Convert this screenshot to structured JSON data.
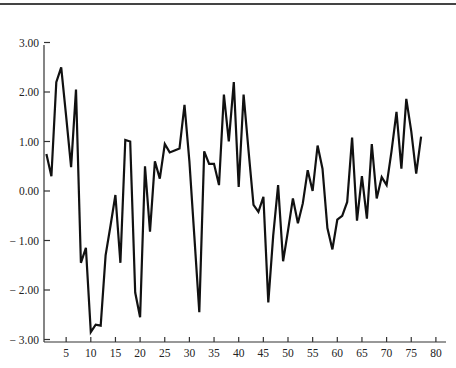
{
  "chart_data": {
    "type": "line",
    "title": "",
    "xlabel": "",
    "ylabel": "",
    "xlim": [
      0,
      81
    ],
    "ylim": [
      -3.0,
      3.0
    ],
    "x_ticks": [
      5,
      10,
      15,
      20,
      25,
      30,
      35,
      40,
      45,
      50,
      55,
      60,
      65,
      70,
      75,
      80
    ],
    "y_ticks": [
      3.0,
      2.0,
      1.0,
      0.0,
      -1.0,
      -2.0,
      -3.0
    ],
    "y_tick_labels": [
      "3.00",
      "2.00",
      "1.00",
      "0.00",
      "− 1.00",
      "− 2.00",
      "− 3.00"
    ],
    "grid": false,
    "legend": null,
    "series": [
      {
        "name": "series",
        "x": [
          1,
          2,
          3,
          4,
          5,
          6,
          7,
          8,
          9,
          10,
          11,
          12,
          13,
          14,
          15,
          16,
          17,
          18,
          19,
          20,
          21,
          22,
          23,
          24,
          25,
          26,
          27,
          28,
          29,
          30,
          31,
          32,
          33,
          34,
          35,
          36,
          37,
          38,
          39,
          40,
          41,
          42,
          43,
          44,
          45,
          46,
          47,
          48,
          49,
          50,
          51,
          52,
          53,
          54,
          55,
          56,
          57,
          58,
          59,
          60,
          61,
          62,
          63,
          64,
          65,
          66,
          67,
          68,
          69,
          70,
          71,
          72,
          73,
          74,
          75,
          76,
          77,
          78,
          79,
          80
        ],
        "values": [
          0.75,
          0.3,
          2.2,
          2.5,
          1.5,
          0.48,
          2.05,
          -1.45,
          -1.15,
          -2.85,
          -2.7,
          -2.72,
          -1.3,
          -0.7,
          -0.08,
          -1.45,
          1.03,
          1.0,
          -2.05,
          -2.55,
          0.5,
          -0.82,
          0.6,
          0.25,
          0.95,
          0.78,
          0.82,
          0.86,
          1.74,
          0.6,
          -0.9,
          -2.45,
          0.8,
          0.55,
          0.55,
          0.12,
          1.95,
          1.0,
          2.2,
          0.08,
          1.95,
          0.8,
          -0.28,
          -0.42,
          -0.12,
          -2.25,
          -0.9,
          0.12,
          -1.42,
          -0.8,
          -0.15,
          -0.65,
          -0.25,
          0.42,
          0.0,
          0.92,
          0.45,
          -0.75,
          -1.18,
          -0.58,
          -0.5,
          -0.22,
          1.08,
          -0.6,
          0.3,
          -0.56,
          0.95,
          -0.15,
          0.28,
          0.12,
          0.8,
          1.6,
          0.45,
          1.86,
          1.2,
          0.35,
          1.1,
          null,
          null,
          null
        ]
      }
    ]
  }
}
